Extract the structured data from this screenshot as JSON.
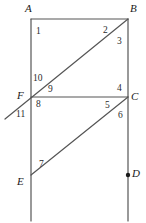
{
  "figure": {
    "width": 146,
    "height": 223,
    "background_color": "#ffffff",
    "line_color": "#555555",
    "label_color": "#1a1a1a",
    "angle_label_color": "#2b2b2b"
  },
  "points": [
    {
      "name": "A",
      "label": "A",
      "x": 31,
      "y": 19,
      "label_x": 25,
      "label_y": 3,
      "marked": false
    },
    {
      "name": "B",
      "label": "B",
      "x": 128,
      "y": 19,
      "label_x": 130,
      "label_y": 3,
      "marked": false
    },
    {
      "name": "F",
      "label": "F",
      "x": 31,
      "y": 97,
      "label_x": 17,
      "label_y": 90,
      "marked": false
    },
    {
      "name": "C",
      "label": "C",
      "x": 128,
      "y": 97,
      "label_x": 131,
      "label_y": 91,
      "marked": false
    },
    {
      "name": "E",
      "label": "E",
      "x": 31,
      "y": 175,
      "label_x": 17,
      "label_y": 176,
      "marked": false
    },
    {
      "name": "D",
      "label": "D",
      "x": 128,
      "y": 175,
      "label_x": 132,
      "label_y": 168,
      "marked": true
    }
  ],
  "segments": [
    {
      "name": "left-vertical-line",
      "x1": 31,
      "y1": 19,
      "x2": 31,
      "y2": 221
    },
    {
      "name": "right-vertical-line",
      "x1": 128,
      "y1": 19,
      "x2": 128,
      "y2": 221
    },
    {
      "name": "segment-AB",
      "x1": 31,
      "y1": 19,
      "x2": 128,
      "y2": 19
    },
    {
      "name": "segment-FC",
      "x1": 31,
      "y1": 97,
      "x2": 128,
      "y2": 97
    },
    {
      "name": "ray-through-F-to-B",
      "x1": 5,
      "y1": 119,
      "x2": 128,
      "y2": 19
    },
    {
      "name": "segment-EC",
      "x1": 31,
      "y1": 175,
      "x2": 128,
      "y2": 97
    }
  ],
  "angle_labels": [
    {
      "name": "angle-1",
      "label": "1",
      "x": 36,
      "y": 27
    },
    {
      "name": "angle-2",
      "label": "2",
      "x": 103,
      "y": 26
    },
    {
      "name": "angle-3",
      "label": "3",
      "x": 117,
      "y": 37
    },
    {
      "name": "angle-4",
      "label": "4",
      "x": 117,
      "y": 84
    },
    {
      "name": "angle-5",
      "label": "5",
      "x": 105,
      "y": 101
    },
    {
      "name": "angle-6",
      "label": "6",
      "x": 118,
      "y": 111
    },
    {
      "name": "angle-7",
      "label": "7",
      "x": 39,
      "y": 160
    },
    {
      "name": "angle-8",
      "label": "8",
      "x": 36,
      "y": 100
    },
    {
      "name": "angle-9",
      "label": "9",
      "x": 48,
      "y": 85
    },
    {
      "name": "angle-10",
      "label": "10",
      "x": 33,
      "y": 74
    },
    {
      "name": "angle-11",
      "label": "11",
      "x": 16,
      "y": 110
    }
  ]
}
